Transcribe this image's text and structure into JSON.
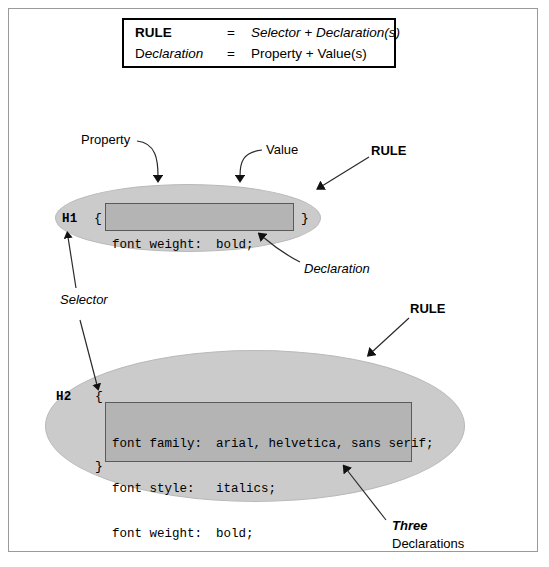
{
  "diagram": {
    "legend": {
      "rows": [
        {
          "term": "RULE",
          "equals": "=",
          "definition": "Selector + Declaration(s)"
        },
        {
          "term_upright": "D",
          "term_italic": "eclaration",
          "equals": "=",
          "definition": "Property + Value(s)"
        }
      ]
    },
    "rules": [
      {
        "selector": "H1",
        "brace_open": "{",
        "brace_close": "}",
        "declarations": [
          {
            "property": "font weight:",
            "value": "bold;"
          }
        ]
      },
      {
        "selector": "H2",
        "brace_open": "{",
        "brace_close": "}",
        "declarations": [
          {
            "property": "font family:",
            "value": "arial, helvetica, sans serif;"
          },
          {
            "property": "font style:",
            "value": "italics;"
          },
          {
            "property": "font weight:",
            "value": "bold;"
          }
        ]
      }
    ],
    "annotations": {
      "property": "Property",
      "value": "Value",
      "rule_top": "RULE",
      "declaration": "Declaration",
      "selector": "Selector",
      "rule_bottom": "RULE",
      "three": "Three",
      "declarations": "Declarations"
    },
    "colors": {
      "ellipse_fill": "#cbcbcb",
      "code_fill": "#b4b4b4",
      "code_border": "#5a5a5a",
      "legend_border": "#000000",
      "page_border": "#9a9a9a",
      "text": "#000000",
      "background": "#ffffff"
    }
  }
}
